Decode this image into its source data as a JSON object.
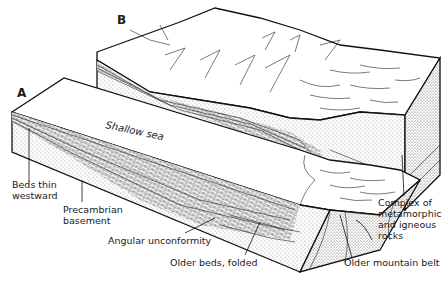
{
  "figure": {
    "type": "geologic block diagram",
    "blocks": [
      {
        "id": "A",
        "label": "A"
      },
      {
        "id": "B",
        "label": "B"
      }
    ],
    "surface_label": "Shallow sea",
    "annotations": [
      {
        "id": "beds-thin",
        "lines": [
          "Beds thin",
          "westward"
        ]
      },
      {
        "id": "precambrian",
        "lines": [
          "Precambrian",
          "basement"
        ]
      },
      {
        "id": "unconformity",
        "lines": [
          "Angular unconformity"
        ]
      },
      {
        "id": "older-beds",
        "lines": [
          "Older beds, folded"
        ]
      },
      {
        "id": "mountain-belt",
        "lines": [
          "Older mountain belt"
        ]
      },
      {
        "id": "complex",
        "lines": [
          "Complex of",
          "metamorphic",
          "and igneous",
          "rocks"
        ]
      }
    ]
  }
}
